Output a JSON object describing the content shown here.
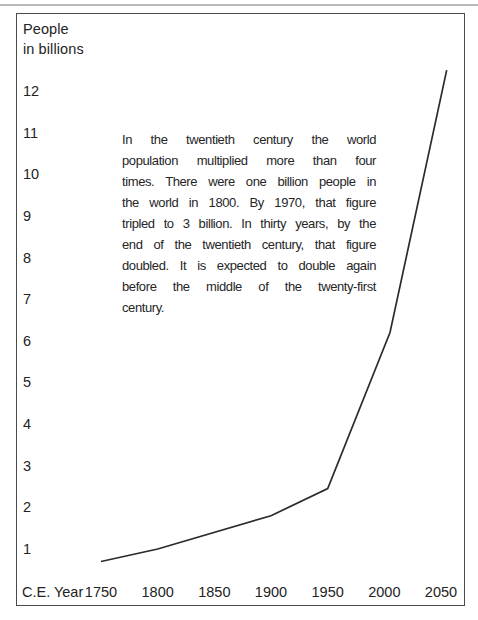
{
  "colors": {
    "background": "#ffffff",
    "text": "#232323",
    "line": "#2b2b2b",
    "frame_border": "#4a4a4a",
    "scan_rule": "#b9b9b9"
  },
  "chart_data": {
    "type": "line",
    "title": "",
    "y_axis_label_line1": "People",
    "y_axis_label_line2": "in billions",
    "x_axis_label": "C.E. Year",
    "xlabel": "C.E. Year",
    "ylabel": "People in billions",
    "xlim": [
      1750,
      2050
    ],
    "ylim": [
      0,
      12.5
    ],
    "grid": false,
    "legend_position": "none",
    "xticks": [
      1750,
      1800,
      1850,
      1900,
      1950,
      2000,
      2050
    ],
    "yticks": [
      12,
      11,
      10,
      9,
      8,
      7,
      6,
      5,
      4,
      3,
      2,
      1
    ],
    "series": [
      {
        "name": "World population in billions",
        "points": [
          {
            "year": 1750,
            "value": 0.7
          },
          {
            "year": 1800,
            "value": 1.0
          },
          {
            "year": 1900,
            "value": 1.8
          },
          {
            "year": 1950,
            "value": 2.45
          },
          {
            "year": 2005,
            "value": 6.2
          },
          {
            "year": 2055,
            "value": 12.5
          }
        ]
      }
    ]
  },
  "annotation": {
    "full_text": "In the twentieth century the world population multiplied more than four times. There were one billion people in the world in 1800. By 1970, that figure tripled to 3 billion. In thirty years, by the end of the twentieth century, that figure doubled. It is expected to double again before the middle of the twenty-first century.",
    "lines": [
      "In the twentieth century the world",
      "population multiplied more than four",
      "times. There were one billion people in",
      "the world in 1800. By 1970, that figure",
      "tripled to 3 billion. In thirty years, by the",
      "end of the twentieth century, that figure",
      "doubled. It is expected to double again",
      "before the middle of the twenty-first",
      "century."
    ]
  }
}
